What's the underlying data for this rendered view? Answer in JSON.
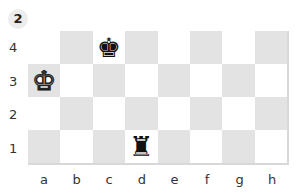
{
  "diagram_number": "2",
  "ranks": [
    "4",
    "3",
    "2",
    "1"
  ],
  "files": [
    "a",
    "b",
    "c",
    "d",
    "e",
    "f",
    "g",
    "h"
  ],
  "squares": [
    [
      "light",
      "dark",
      "light",
      "dark",
      "light",
      "dark",
      "light",
      "dark"
    ],
    [
      "dark",
      "light",
      "dark",
      "light",
      "dark",
      "light",
      "dark",
      "light"
    ],
    [
      "light",
      "dark",
      "light",
      "dark",
      "light",
      "dark",
      "light",
      "dark"
    ],
    [
      "dark",
      "light",
      "dark",
      "light",
      "dark",
      "light",
      "dark",
      "light"
    ]
  ],
  "pieces": [
    {
      "square": "c4",
      "row": 0,
      "col": 2,
      "glyph": "♚",
      "color": "black",
      "name": "black-king"
    },
    {
      "square": "a3",
      "row": 1,
      "col": 0,
      "glyph": "♚",
      "color": "white",
      "name": "white-king"
    },
    {
      "square": "d1",
      "row": 3,
      "col": 3,
      "glyph": "♜",
      "color": "black",
      "name": "black-rook"
    }
  ],
  "colors": {
    "light": "#ffffff",
    "dark": "#e3e3e3",
    "badge": "#ececec"
  }
}
